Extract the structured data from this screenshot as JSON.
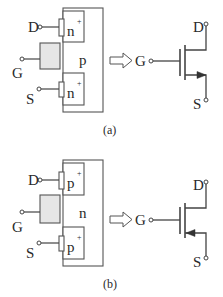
{
  "figures": [
    {
      "id": "a",
      "caption": "(a)",
      "device_type": "n-channel MOSFET",
      "structure": {
        "substrate_label": "p",
        "drain_region": {
          "label": "n",
          "sup": "+"
        },
        "source_region": {
          "label": "n",
          "sup": "+"
        },
        "gate_label": "G",
        "drain_label": "D",
        "source_label": "S"
      },
      "equivalence_arrow": "hollow-right-arrow-icon",
      "symbol": {
        "gate_label": "G",
        "drain_label": "D",
        "source_label": "S",
        "arrow_direction": "outward"
      }
    },
    {
      "id": "b",
      "caption": "(b)",
      "device_type": "p-channel MOSFET",
      "structure": {
        "substrate_label": "n",
        "drain_region": {
          "label": "p",
          "sup": "+"
        },
        "source_region": {
          "label": "p",
          "sup": "+"
        },
        "gate_label": "G",
        "drain_label": "D",
        "source_label": "S"
      },
      "equivalence_arrow": "hollow-right-arrow-icon",
      "symbol": {
        "gate_label": "G",
        "drain_label": "D",
        "source_label": "S",
        "arrow_direction": "inward"
      }
    }
  ]
}
